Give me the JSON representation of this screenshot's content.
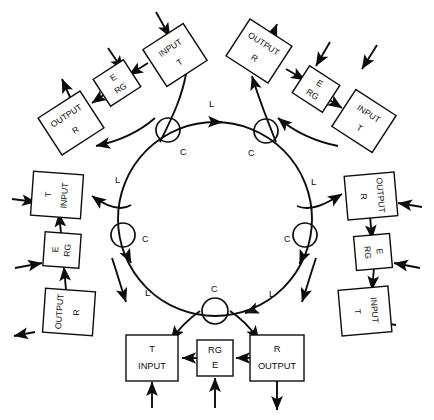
{
  "diagram": {
    "ring_label": "L",
    "coupler_label": "C",
    "colors": {
      "line": "#0d0d0d",
      "background": "#ffffff",
      "box_fill": "#ffffff"
    },
    "labels": {
      "input": "INPUT",
      "output": "OUTPUT",
      "transmitter": "T",
      "receiver": "R",
      "regenerator": "RG",
      "equipment": "E"
    },
    "link_labels": [
      {
        "id": "L-top",
        "text": "L",
        "x": 212,
        "y": 104
      },
      {
        "id": "L-upper-left",
        "text": "L",
        "x": 118,
        "y": 180
      },
      {
        "id": "L-upper-right",
        "text": "L",
        "x": 313,
        "y": 182
      },
      {
        "id": "L-lower-left",
        "text": "L",
        "x": 148,
        "y": 293
      },
      {
        "id": "L-lower-right",
        "text": "L",
        "x": 272,
        "y": 294
      }
    ],
    "couplers": [
      {
        "id": "coupler-top-left",
        "label": "C",
        "cx": 168,
        "cy": 130,
        "r": 12,
        "lx": 180,
        "ly": 152
      },
      {
        "id": "coupler-top-right",
        "label": "C",
        "cx": 266,
        "cy": 131,
        "r": 12,
        "lx": 249,
        "ly": 153
      },
      {
        "id": "coupler-mid-left",
        "label": "C",
        "cx": 123,
        "cy": 235,
        "r": 12,
        "lx": 142,
        "ly": 239
      },
      {
        "id": "coupler-mid-right",
        "label": "C",
        "cx": 305,
        "cy": 235,
        "r": 12,
        "lx": 285,
        "ly": 239
      },
      {
        "id": "coupler-bottom",
        "label": "C",
        "cx": 215,
        "cy": 311,
        "r": 13,
        "lx": 212,
        "ly": 290
      }
    ],
    "nodes": [
      {
        "id": "node-top-left",
        "position": "top-left",
        "boxes": [
          {
            "id": "box-input-t",
            "line1": "INPUT",
            "line2": "T"
          },
          {
            "id": "box-e-rg",
            "line1": "E",
            "line2": "RG"
          },
          {
            "id": "box-output-r",
            "line1": "OUTPUT",
            "line2": "R"
          }
        ]
      },
      {
        "id": "node-top-right",
        "position": "top-right",
        "boxes": [
          {
            "id": "box-output-r",
            "line1": "OUTPUT",
            "line2": "R"
          },
          {
            "id": "box-e-rg",
            "line1": "E",
            "line2": "RG"
          },
          {
            "id": "box-input-t",
            "line1": "INPUT",
            "line2": "T"
          }
        ]
      },
      {
        "id": "node-left",
        "position": "left",
        "boxes": [
          {
            "id": "box-input-t",
            "line1": "INPUT",
            "line2": "T"
          },
          {
            "id": "box-rg-e",
            "line1": "RG",
            "line2": "E"
          },
          {
            "id": "box-output-r",
            "line1": "OUTPUT",
            "line2": "R"
          }
        ]
      },
      {
        "id": "node-right",
        "position": "right",
        "boxes": [
          {
            "id": "box-r-output",
            "line1": "R",
            "line2": "OUTPUT"
          },
          {
            "id": "box-rg-e",
            "line1": "RG",
            "line2": "E"
          },
          {
            "id": "box-t-input",
            "line1": "T",
            "line2": "INPUT"
          }
        ]
      },
      {
        "id": "node-bottom",
        "position": "bottom",
        "boxes": [
          {
            "id": "box-t-input",
            "line1": "T",
            "line2": "INPUT"
          },
          {
            "id": "box-rg-e",
            "line1": "RG",
            "line2": "E"
          },
          {
            "id": "box-r-output",
            "line1": "R",
            "line2": "OUTPUT"
          }
        ]
      }
    ]
  }
}
